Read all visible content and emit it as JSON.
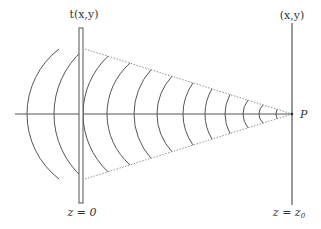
{
  "diagram": {
    "labels": {
      "plate_top": "t(x,y)",
      "screen_top": "(x,y)",
      "point": "P",
      "plate_bottom": "z = 0",
      "screen_bottom_prefix": "z = z",
      "screen_bottom_subscript": "0"
    },
    "colors": {
      "line": "#555555",
      "dotted": "#777777",
      "background": "#ffffff"
    },
    "geometry": {
      "axis_y": 114,
      "axis_x_start": 15,
      "axis_x_end": 293,
      "focus_point": [
        292,
        114
      ],
      "plate": {
        "x": 79,
        "width": 4,
        "y_top": 28,
        "y_bottom": 203
      },
      "screen": {
        "x": 292,
        "y_top": 23,
        "y_bottom": 205
      },
      "cone_top_start": [
        85,
        49
      ],
      "cone_bottom_start": [
        85,
        179
      ],
      "incident_arcs": [
        {
          "axis_x": 27,
          "end_x": 59,
          "end_dy": 65
        },
        {
          "axis_x": 54,
          "end_x": 83,
          "end_dy": 64
        }
      ],
      "converging_arcs_axis_x": [
        83,
        107,
        134,
        157,
        183,
        205,
        225,
        243,
        259,
        276
      ],
      "converging_arcs_end_x": [
        108,
        130,
        151,
        172,
        193,
        212,
        230,
        248,
        263,
        277
      ]
    }
  }
}
